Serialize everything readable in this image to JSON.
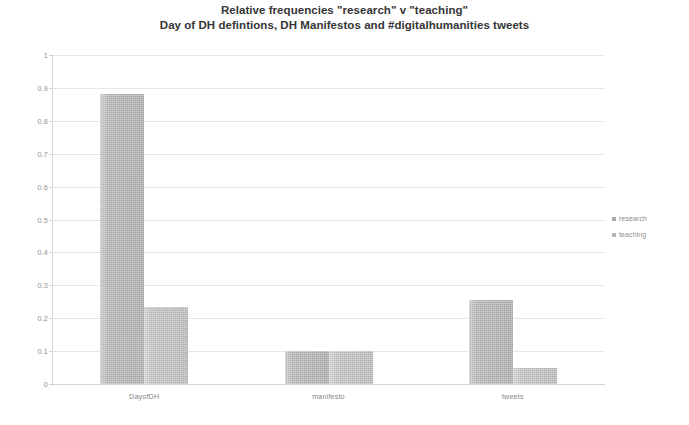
{
  "chart_data": {
    "type": "bar",
    "title_line1": "Relative frequencies \"research\" v \"teaching\"",
    "title_line2": "Day of DH defintions, DH Manifestos and #digitalhumanities tweets",
    "xlabel": "",
    "ylabel": "",
    "ylim": [
      0,
      1
    ],
    "grid": true,
    "legend_position": "right",
    "categories": [
      "DayofDH",
      "manifesto",
      "tweets"
    ],
    "series": [
      {
        "name": "research",
        "color": "#a5a5a5",
        "values": [
          0.88,
          0.1,
          0.255
        ]
      },
      {
        "name": "teaching",
        "color": "#b3b3b3",
        "values": [
          0.235,
          0.1,
          0.05
        ]
      }
    ],
    "yticks": [
      "0",
      "0.1",
      "0.2",
      "0.3",
      "0.4",
      "0.5",
      "0.6",
      "0.7",
      "0.8",
      "0.9",
      "1"
    ],
    "ytick_values": [
      0,
      0.1,
      0.2,
      0.3,
      0.4,
      0.5,
      0.6,
      0.7,
      0.8,
      0.9,
      1
    ]
  },
  "legend": {
    "items": [
      {
        "label": "research"
      },
      {
        "label": "teaching"
      }
    ]
  }
}
